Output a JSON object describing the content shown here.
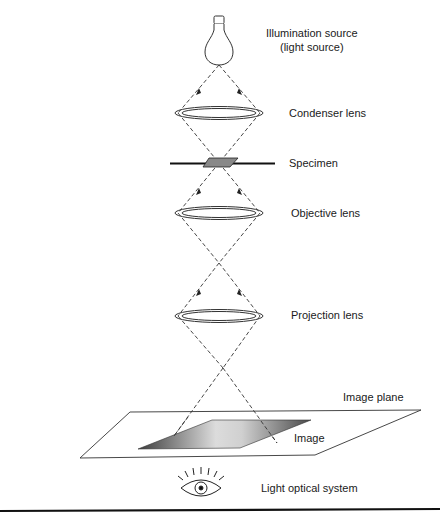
{
  "diagram": {
    "title": "Light optical system",
    "components": [
      {
        "id": "illumination-source",
        "label_line1": "Illumination source",
        "label_line2": "(light source)",
        "icon": "light-bulb-icon"
      },
      {
        "id": "condenser-lens",
        "label": "Condenser lens"
      },
      {
        "id": "specimen",
        "label": "Specimen"
      },
      {
        "id": "objective-lens",
        "label": "Objective lens"
      },
      {
        "id": "projection-lens",
        "label": "Projection lens"
      },
      {
        "id": "image-plane",
        "label": "Image plane"
      },
      {
        "id": "image",
        "label": "Image"
      },
      {
        "id": "viewer-eye",
        "label": "Light optical system",
        "icon": "eye-icon"
      }
    ],
    "colors": {
      "line": "#333333",
      "image_dark": "#4a4a4a",
      "image_light": "#d8d8d8",
      "background": "#ffffff"
    }
  }
}
